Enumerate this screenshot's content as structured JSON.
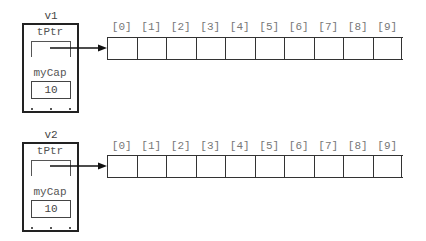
{
  "vectors": [
    {
      "name": "v1",
      "fields": {
        "pointer_label": "tPtr",
        "capacity_label": "myCap",
        "capacity_value": "10"
      },
      "ellipsis": ". . .",
      "array": {
        "indices": [
          "[0]",
          "[1]",
          "[2]",
          "[3]",
          "[4]",
          "[5]",
          "[6]",
          "[7]",
          "[8]",
          "[9]"
        ],
        "cells": [
          "",
          "",
          "",
          "",
          "",
          "",
          "",
          "",
          "",
          ""
        ]
      }
    },
    {
      "name": "v2",
      "fields": {
        "pointer_label": "tPtr",
        "capacity_label": "myCap",
        "capacity_value": "10"
      },
      "ellipsis": ". . .",
      "array": {
        "indices": [
          "[0]",
          "[1]",
          "[2]",
          "[3]",
          "[4]",
          "[5]",
          "[6]",
          "[7]",
          "[8]",
          "[9]"
        ],
        "cells": [
          "",
          "",
          "",
          "",
          "",
          "",
          "",
          "",
          "",
          ""
        ]
      }
    }
  ],
  "colors": {
    "stroke": "#222222",
    "label": "#555555",
    "index": "#777777"
  }
}
